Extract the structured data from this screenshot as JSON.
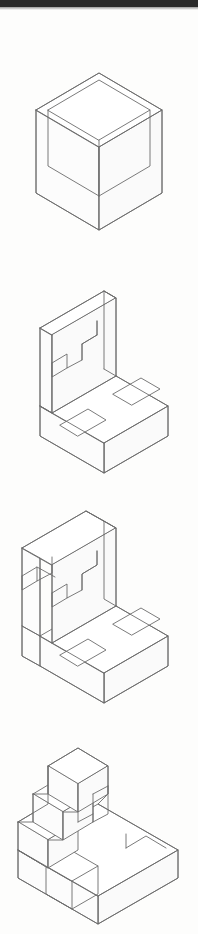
{
  "page": {
    "title": "Isometric Pictorial Drawings",
    "background_color": "#fdfdfc",
    "line_color": "#6c6c6c",
    "rule_color": "#2a2a2a",
    "width": 198,
    "height": 934
  },
  "header_rule": {
    "name": "top-rule",
    "label": "",
    "color": "#2a2a2a"
  },
  "figures": [
    {
      "id": "figure-1",
      "label": "",
      "description": "Open-top rectangular box shown in isometric projection",
      "shape_type": "open-box",
      "top": 48,
      "height": 205
    },
    {
      "id": "figure-2",
      "label": "",
      "description": "L-shaped block with stepped notch in vertical wall and rectangular slots in base",
      "shape_type": "stepped-L-block",
      "top": 268,
      "height": 215
    },
    {
      "id": "figure-3",
      "label": "",
      "description": "L-shaped block with double stepped notches in vertical wall and rectangular slots in base",
      "shape_type": "double-stepped-L-block",
      "top": 498,
      "height": 215
    },
    {
      "id": "figure-4",
      "label": "",
      "description": "Stepped staircase block with notched base plate",
      "shape_type": "staircase-block",
      "top": 728,
      "height": 200
    }
  ]
}
